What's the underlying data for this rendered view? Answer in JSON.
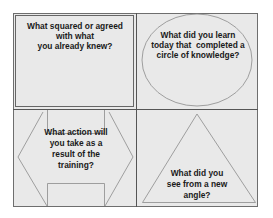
{
  "diagram": {
    "layout": "2x2 reflection grid",
    "colors": {
      "background": "#ffffff",
      "panel_fill": "#e9e9e9",
      "border": "#6e6e6e",
      "shape_stroke": "#8a8a8a",
      "text": "#1a1a1a"
    },
    "quadrants": [
      {
        "position": "top-left",
        "shape": "square",
        "lines": [
          "What squared or agreed",
          "with what",
          "you already knew?"
        ]
      },
      {
        "position": "top-right",
        "shape": "circle",
        "lines": [
          "What did you learn",
          "today that  completed a",
          "circle of knowledge?"
        ]
      },
      {
        "position": "bottom-left",
        "shape": "notched-hexagon-arrow",
        "lines": [
          "What action will",
          "you take as a",
          "result of the",
          "training?"
        ]
      },
      {
        "position": "bottom-right",
        "shape": "triangle",
        "lines": [
          "What did you",
          "see from a new",
          "angle?"
        ]
      }
    ]
  }
}
